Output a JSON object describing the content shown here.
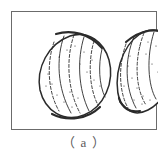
{
  "figure": {
    "caption": "（ a ）",
    "frame": {
      "border_color": "#6b6b6b",
      "background_color": "#ffffff",
      "x": 11,
      "y": 11,
      "width": 146,
      "height": 119
    },
    "ink_color": "#2b2b2b",
    "specimens": [
      {
        "id": "left-specimen",
        "label": "left shell outline",
        "orientation": "lens-shaped, apex upper-right",
        "outline_path": "M 28 78 C 24 56 36 32 58 24 C 76 18 92 30 97 48 C 103 70 92 95 72 103 C 52 111 33 99 28 78 Z",
        "rim_arcs": [
          "M 44 22 C 60 17 78 22 90 36",
          "M 40 102 C 56 110 76 107 88 95"
        ],
        "growth_lines": [
          {
            "d": "M 52 24 C 44 46 45 76 59 101",
            "dash": "none"
          },
          {
            "d": "M 62 23 C 54 46 55 77 68 101",
            "dash": "3,2"
          },
          {
            "d": "M 72 25 C 65 47 66 77 77 99",
            "dash": "none"
          },
          {
            "d": "M 82 29 C 76 49 77 76 86 93",
            "dash": "3,2"
          },
          {
            "d": "M 90 37 C 86 53 87 73 93 85",
            "dash": "none"
          },
          {
            "d": "M 42 30 C 35 50 35 78 47 99",
            "dash": "3,2"
          }
        ],
        "speckles": [
          [
            36,
            62
          ],
          [
            40,
            72
          ],
          [
            45,
            83
          ],
          [
            52,
            90
          ],
          [
            60,
            95
          ],
          [
            68,
            52
          ],
          [
            75,
            60
          ],
          [
            82,
            68
          ],
          [
            88,
            74
          ],
          [
            47,
            45
          ],
          [
            55,
            38
          ],
          [
            63,
            34
          ],
          [
            72,
            40
          ],
          [
            80,
            48
          ],
          [
            34,
            74
          ],
          [
            58,
            80
          ],
          [
            66,
            86
          ]
        ]
      },
      {
        "id": "right-specimen",
        "label": "right shell outline",
        "orientation": "comma/leaf-shaped, apex upper-right",
        "outline_path": "M 108 90 C 100 64 110 34 128 22 C 144 12 158 22 161 42 C 165 66 152 90 136 98 C 126 103 119 101 114 96 C 112 94 110 92 108 90 Z",
        "rim_arcs": [
          "M 114 30 C 128 18 146 14 158 24",
          "M 107 86 C 110 96 118 101 128 99"
        ],
        "growth_lines": [
          {
            "d": "M 122 25 C 112 48 113 76 124 96",
            "dash": "none"
          },
          {
            "d": "M 132 21 C 122 46 123 76 134 93",
            "dash": "3,2"
          },
          {
            "d": "M 142 20 C 134 45 136 74 144 87",
            "dash": "none"
          },
          {
            "d": "M 151 23 C 145 46 147 70 153 80",
            "dash": "3,2"
          },
          {
            "d": "M 114 32 C 106 54 107 80 116 96",
            "dash": "3,2"
          },
          {
            "d": "M 157 30 C 154 48 155 65 158 72",
            "dash": "none"
          }
        ],
        "speckles": [
          [
            116,
            54
          ],
          [
            120,
            66
          ],
          [
            125,
            76
          ],
          [
            131,
            84
          ],
          [
            138,
            88
          ],
          [
            134,
            42
          ],
          [
            140,
            52
          ],
          [
            146,
            60
          ],
          [
            150,
            66
          ],
          [
            128,
            34
          ],
          [
            136,
            30
          ],
          [
            144,
            34
          ],
          [
            150,
            42
          ],
          [
            112,
            74
          ],
          [
            122,
            88
          ],
          [
            130,
            92
          ],
          [
            154,
            52
          ],
          [
            118,
            44
          ]
        ]
      }
    ]
  }
}
